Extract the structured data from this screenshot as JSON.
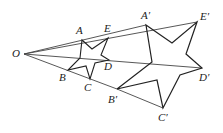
{
  "diagram": {
    "labels": {
      "O": "O",
      "A": "A",
      "B": "B",
      "C": "C",
      "D": "D",
      "E": "E",
      "A1": "A′",
      "B1": "B′",
      "C1": "C′",
      "D1": "D′",
      "E1": "E′"
    },
    "colors": {
      "stroke": "#222222",
      "ray": "#444444"
    }
  }
}
